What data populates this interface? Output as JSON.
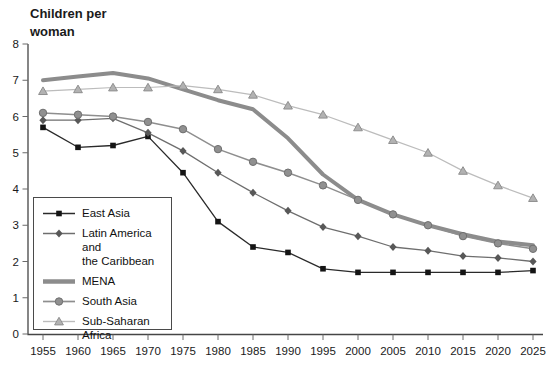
{
  "title": {
    "line1": "Children per",
    "line2": "woman"
  },
  "chart_data": {
    "type": "line",
    "title": "Children per woman",
    "ylabel": "Children per woman",
    "xlabel": "",
    "ylim": [
      0,
      8
    ],
    "y_ticks": [
      0,
      1,
      2,
      3,
      4,
      5,
      6,
      7,
      8
    ],
    "grid": false,
    "legend_position": "lower-left",
    "x": [
      1955,
      1960,
      1965,
      1970,
      1975,
      1980,
      1985,
      1990,
      1995,
      2000,
      2005,
      2010,
      2015,
      2020,
      2025
    ],
    "series": [
      {
        "name": "East Asia",
        "legend_label": "East Asia",
        "marker": "square",
        "color": "#2a2a2a",
        "marker_color": "#141414",
        "line_width": 1.3,
        "values": [
          5.7,
          5.15,
          5.2,
          5.45,
          4.45,
          3.1,
          2.4,
          2.25,
          1.8,
          1.7,
          1.7,
          1.7,
          1.7,
          1.7,
          1.75
        ]
      },
      {
        "name": "Latin America and the Caribbean",
        "legend_label": "Latin America and\nthe Caribbean",
        "marker": "diamond",
        "color": "#6e6e6e",
        "marker_color": "#585858",
        "line_width": 1.3,
        "values": [
          5.9,
          5.9,
          5.95,
          5.55,
          5.05,
          4.45,
          3.9,
          3.4,
          2.95,
          2.7,
          2.4,
          2.3,
          2.15,
          2.1,
          2.0
        ]
      },
      {
        "name": "MENA",
        "legend_label": "MENA",
        "marker": "none",
        "color": "#8c8c8c",
        "marker_color": "#8c8c8c",
        "line_width": 4,
        "values": [
          7.0,
          7.1,
          7.2,
          7.05,
          6.75,
          6.45,
          6.2,
          5.4,
          4.4,
          3.7,
          3.3,
          3.0,
          2.75,
          2.55,
          2.45
        ]
      },
      {
        "name": "South Asia",
        "legend_label": "South Asia",
        "marker": "circle",
        "color": "#8e8e8e",
        "marker_color": "#909090",
        "marker_edge": "#6f6f6f",
        "line_width": 1.5,
        "values": [
          6.1,
          6.05,
          6.0,
          5.85,
          5.65,
          5.1,
          4.75,
          4.45,
          4.1,
          3.7,
          3.3,
          3.0,
          2.7,
          2.5,
          2.35
        ]
      },
      {
        "name": "Sub-Saharan Africa",
        "legend_label": "Sub-Saharan\nAfrica",
        "marker": "triangle",
        "color": "#bcbcbc",
        "marker_color": "#b2b2b2",
        "marker_edge": "#8f8f8f",
        "line_width": 1.2,
        "values": [
          6.7,
          6.75,
          6.8,
          6.8,
          6.85,
          6.75,
          6.6,
          6.3,
          6.05,
          5.7,
          5.35,
          5.0,
          4.5,
          4.1,
          3.75
        ]
      }
    ]
  }
}
